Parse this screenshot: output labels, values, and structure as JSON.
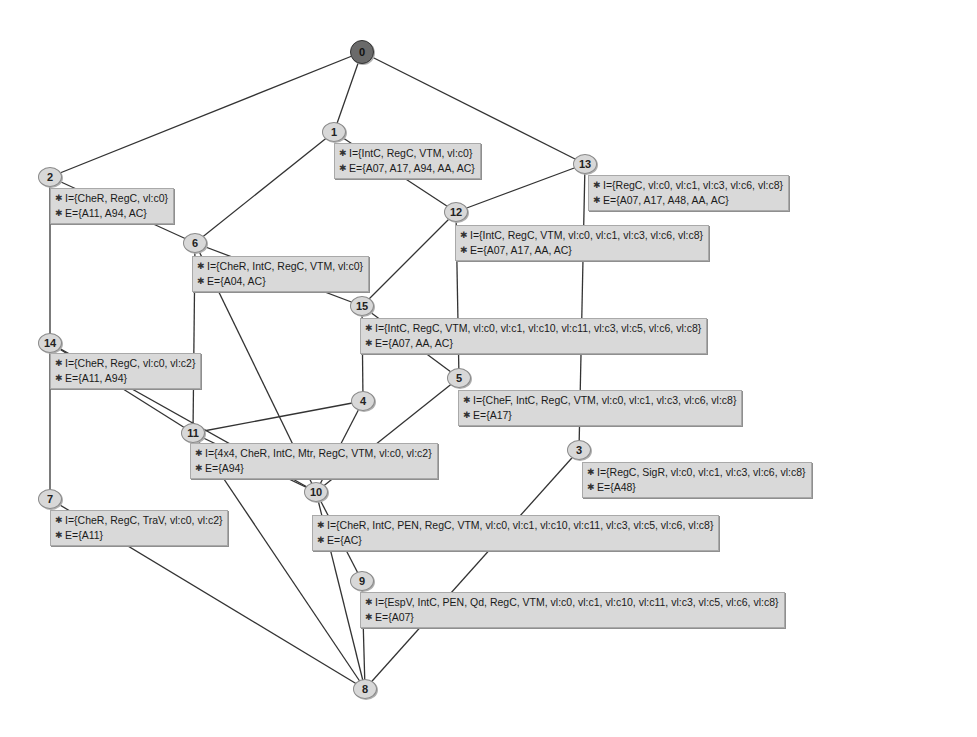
{
  "diagram": {
    "type": "concept-lattice",
    "icon": "bug-icon",
    "intent_prefix": "I=",
    "extent_prefix": "E=",
    "colors": {
      "edge": "#333333",
      "label_bg": "#d9d9d9",
      "node_bg": "#d8d8d8",
      "root_bg": "#6a6a6a"
    },
    "nodes": [
      {
        "id": "0",
        "x": 362,
        "y": 20
      },
      {
        "id": "1",
        "x": 334,
        "y": 132
      },
      {
        "id": "2",
        "x": 50,
        "y": 177
      },
      {
        "id": "13",
        "x": 585,
        "y": 164
      },
      {
        "id": "12",
        "x": 456,
        "y": 212
      },
      {
        "id": "6",
        "x": 195,
        "y": 243
      },
      {
        "id": "15",
        "x": 362,
        "y": 306
      },
      {
        "id": "14",
        "x": 50,
        "y": 343
      },
      {
        "id": "5",
        "x": 459,
        "y": 378
      },
      {
        "id": "4",
        "x": 363,
        "y": 401
      },
      {
        "id": "11",
        "x": 193,
        "y": 433
      },
      {
        "id": "3",
        "x": 579,
        "y": 450
      },
      {
        "id": "10",
        "x": 316,
        "y": 492
      },
      {
        "id": "7",
        "x": 50,
        "y": 499
      },
      {
        "id": "9",
        "x": 362,
        "y": 581
      },
      {
        "id": "8",
        "x": 365,
        "y": 689
      }
    ],
    "labels": [
      {
        "node": "1",
        "x": 334,
        "y": 143,
        "intent": "I={IntC, RegC, VTM, vl:c0}",
        "extent": "E={A07, A17, A94, AA, AC}"
      },
      {
        "node": "2",
        "x": 50,
        "y": 188,
        "intent": "I={CheR, RegC, vl:c0}",
        "extent": "E={A11, A94, AC}"
      },
      {
        "node": "13",
        "x": 588,
        "y": 175,
        "intent": "I={RegC, vl:c0, vl:c1, vl:c3, vl:c6, vl:c8}",
        "extent": "E={A07, A17, A48, AA, AC}"
      },
      {
        "node": "12",
        "x": 455,
        "y": 225,
        "intent": "I={IntC, RegC, VTM, vl:c0, vl:c1, vl:c3, vl:c6, vl:c8}",
        "extent": "E={A07, A17, AA, AC}"
      },
      {
        "node": "6",
        "x": 192,
        "y": 256,
        "intent": "I={CheR, IntC, RegC, VTM, vl:c0}",
        "extent": "E={A04, AC}"
      },
      {
        "node": "15",
        "x": 360,
        "y": 318,
        "intent": "I={IntC, RegC, VTM, vl:c0, vl:c1, vl:c10, vl:c11, vl:c3, vl:c5, vl:c6, vl:c8}",
        "extent": "E={A07, AA, AC}"
      },
      {
        "node": "14",
        "x": 50,
        "y": 353,
        "intent": "I={CheR, RegC, vl:c0, vl:c2}",
        "extent": "E={A11, A94}"
      },
      {
        "node": "5",
        "x": 458,
        "y": 390,
        "intent": "I={CheF, IntC, RegC, VTM, vl:c0, vl:c1, vl:c3, vl:c6, vl:c8}",
        "extent": "E={A17}"
      },
      {
        "node": "11",
        "x": 190,
        "y": 443,
        "intent": "I={4x4, CheR, IntC, Mtr, RegC, VTM, vl:c0, vl:c2}",
        "extent": "E={A94}"
      },
      {
        "node": "3",
        "x": 582,
        "y": 462,
        "intent": "I={RegC, SigR, vl:c0, vl:c1, vl:c3, vl:c6, vl:c8}",
        "extent": "E={A48}"
      },
      {
        "node": "10",
        "x": 312,
        "y": 515,
        "intent": "I={CheR, IntC, PEN, RegC, VTM, vl:c0, vl:c1, vl:c10, vl:c11, vl:c3, vl:c5, vl:c6, vl:c8}",
        "extent": "E={AC}"
      },
      {
        "node": "7",
        "x": 50,
        "y": 510,
        "intent": "I={CheR, RegC, TraV, vl:c0, vl:c2}",
        "extent": "E={A11}"
      },
      {
        "node": "9",
        "x": 360,
        "y": 592,
        "intent": "I={EspV, IntC, PEN, Qd, RegC, VTM, vl:c0, vl:c1, vl:c10, vl:c11, vl:c3, vl:c5, vl:c6, vl:c8}",
        "extent": "E={A07}"
      }
    ],
    "edges": [
      [
        "0",
        "1"
      ],
      [
        "0",
        "2"
      ],
      [
        "0",
        "13"
      ],
      [
        "1",
        "6"
      ],
      [
        "1",
        "12"
      ],
      [
        "13",
        "12"
      ],
      [
        "13",
        "3"
      ],
      [
        "2",
        "6"
      ],
      [
        "2",
        "14"
      ],
      [
        "12",
        "15"
      ],
      [
        "12",
        "5"
      ],
      [
        "6",
        "15"
      ],
      [
        "6",
        "11"
      ],
      [
        "6",
        "10"
      ],
      [
        "15",
        "4"
      ],
      [
        "15",
        "5"
      ],
      [
        "14",
        "11"
      ],
      [
        "14",
        "7"
      ],
      [
        "14",
        "10"
      ],
      [
        "4",
        "11"
      ],
      [
        "4",
        "10"
      ],
      [
        "5",
        "10"
      ],
      [
        "11",
        "10"
      ],
      [
        "11",
        "8"
      ],
      [
        "3",
        "8"
      ],
      [
        "10",
        "9"
      ],
      [
        "10",
        "8"
      ],
      [
        "7",
        "8"
      ],
      [
        "9",
        "8"
      ]
    ]
  }
}
